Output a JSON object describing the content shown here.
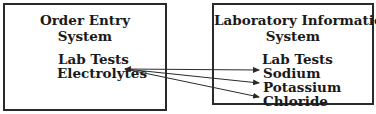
{
  "left_box": {
    "title_line1": "Order Entry",
    "title_line2": "System",
    "section": "Lab Tests",
    "items": [
      "Electrolytes"
    ]
  },
  "right_box": {
    "title_line1": "Laboratory Information",
    "title_line2": "System",
    "section": "Lab Tests",
    "items": [
      "Sodium",
      "Potassium",
      "Chloride"
    ]
  },
  "arrows": [
    {
      "from": "Electrolytes",
      "to": "Sodium"
    },
    {
      "from": "Electrolytes",
      "to": "Potassium"
    },
    {
      "from": "Electrolytes",
      "to": "Chloride"
    }
  ]
}
